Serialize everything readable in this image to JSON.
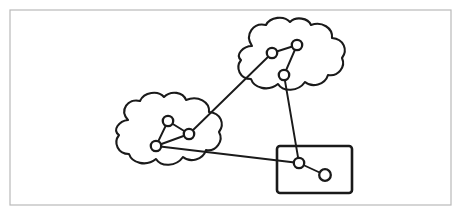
{
  "figure": {
    "canvas": {
      "width": 461,
      "height": 215
    },
    "colors": {
      "background": "#ffffff",
      "frame_stroke": "#b9b9b9",
      "ink": "#1a1a1a",
      "node_fill": "#ffffff"
    }
  },
  "frame": {
    "name": "outer-border",
    "x": 10,
    "y": 10,
    "width": 441,
    "height": 195,
    "stroke_width": 1.2
  },
  "regions": [
    {
      "id": "cloud-top",
      "type": "cloud",
      "label": "",
      "bbox": {
        "x": 240,
        "y": 22,
        "width": 105,
        "height": 73
      },
      "path": "M 252 46 C 244 34 254 22 266 25 C 270 17 284 15 290 22 C 296 16 308 18 311 25 C 322 21 333 28 332 38 C 344 39 348 50 342 58 C 346 67 338 77 328 75 C 325 85 312 88 305 82 C 298 92 283 92 278 84 C 268 92 254 88 251 79 C 240 79 235 68 241 60 C 235 55 243 46 252 46 Z"
    },
    {
      "id": "cloud-left",
      "type": "cloud",
      "label": "",
      "bbox": {
        "x": 114,
        "y": 95,
        "width": 111,
        "height": 73
      },
      "path": "M 128 120 C 119 110 128 98 140 101 C 144 92 158 90 164 97 C 171 90 183 92 186 100 C 198 95 210 102 209 112 C 221 113 225 124 219 132 C 224 141 216 152 206 150 C 203 160 190 163 183 157 C 176 167 161 167 156 159 C 146 167 132 163 129 154 C 118 154 113 143 119 135 C 112 130 119 121 128 120 Z"
    },
    {
      "id": "box-right",
      "type": "rectangle",
      "label": "",
      "bbox": {
        "x": 277,
        "y": 146,
        "width": 75,
        "height": 47
      },
      "corner_radius": 3
    }
  ],
  "nodes": [
    {
      "id": "t1",
      "region": "cloud-top",
      "x": 272,
      "y": 53,
      "r": 5.2
    },
    {
      "id": "t2",
      "region": "cloud-top",
      "x": 297,
      "y": 45,
      "r": 5.2
    },
    {
      "id": "t3",
      "region": "cloud-top",
      "x": 284,
      "y": 75,
      "r": 5.2
    },
    {
      "id": "l1",
      "region": "cloud-left",
      "x": 168,
      "y": 121,
      "r": 5.2
    },
    {
      "id": "l2",
      "region": "cloud-left",
      "x": 189,
      "y": 134,
      "r": 5.2
    },
    {
      "id": "l3",
      "region": "cloud-left",
      "x": 156,
      "y": 146,
      "r": 5.2
    },
    {
      "id": "b1",
      "region": "box-right",
      "x": 299,
      "y": 163,
      "r": 5.2
    },
    {
      "id": "b2",
      "region": "box-right",
      "x": 325,
      "y": 175,
      "r": 5.8
    }
  ],
  "edges": [
    {
      "id": "e-t1-t2",
      "from": "t1",
      "to": "t2",
      "scope": "intra"
    },
    {
      "id": "e-t2-t3",
      "from": "t2",
      "to": "t3",
      "scope": "intra"
    },
    {
      "id": "e-l1-l2",
      "from": "l1",
      "to": "l2",
      "scope": "intra"
    },
    {
      "id": "e-l1-l3",
      "from": "l1",
      "to": "l3",
      "scope": "intra"
    },
    {
      "id": "e-l2-l3",
      "from": "l2",
      "to": "l3",
      "scope": "intra"
    },
    {
      "id": "e-b1-b2",
      "from": "b1",
      "to": "b2",
      "scope": "intra"
    },
    {
      "id": "e-l2-t1",
      "from": "l2",
      "to": "t1",
      "scope": "inter"
    },
    {
      "id": "e-t3-b1",
      "from": "t3",
      "to": "b1",
      "scope": "inter"
    },
    {
      "id": "e-l3-b1",
      "from": "l3",
      "to": "b1",
      "scope": "inter"
    }
  ]
}
